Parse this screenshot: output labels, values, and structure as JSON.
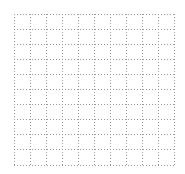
{
  "grid": {
    "columns": 10,
    "rows": 10,
    "line_style": "dotted",
    "line_color": "#9a9a9a",
    "background_color": "#ffffff"
  }
}
